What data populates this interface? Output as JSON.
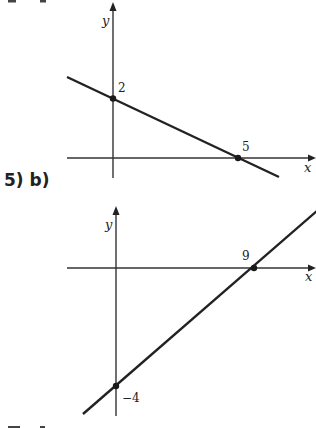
{
  "problems": [
    {
      "label": "5) a)",
      "axes": {
        "x_label": "x",
        "y_label": "y"
      },
      "points": [
        {
          "label": "2",
          "x": 0,
          "y": 2
        },
        {
          "label": "5",
          "x": 5,
          "y": 0
        }
      ]
    },
    {
      "label": "5) b)",
      "axes": {
        "x_label": "x",
        "y_label": "y"
      },
      "points": [
        {
          "label": "9",
          "x": 9,
          "y": 0
        },
        {
          "label": "−4",
          "x": 0,
          "y": -4
        }
      ]
    },
    {
      "label": "5) c)"
    }
  ]
}
